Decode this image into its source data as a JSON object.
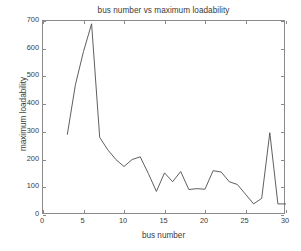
{
  "chart_data": {
    "type": "line",
    "title": "bus number vs maximum loadability",
    "xlabel": "bus number",
    "ylabel": "maximum loadability",
    "xlim": [
      0,
      30
    ],
    "ylim": [
      0,
      700
    ],
    "xticks": [
      0,
      5,
      10,
      15,
      20,
      25,
      30
    ],
    "yticks": [
      0,
      100,
      200,
      300,
      400,
      500,
      600,
      700
    ],
    "grid": false,
    "legend": false,
    "line_color": "#4d4d4d",
    "series": [
      {
        "name": "maximum loadability",
        "x": [
          3,
          4,
          5,
          6,
          7,
          8,
          9,
          10,
          11,
          12,
          13,
          14,
          15,
          16,
          17,
          18,
          19,
          20,
          21,
          22,
          23,
          24,
          25,
          26,
          27,
          28,
          29,
          30
        ],
        "values": [
          290,
          470,
          590,
          690,
          280,
          235,
          200,
          175,
          200,
          210,
          150,
          85,
          152,
          120,
          157,
          92,
          95,
          93,
          160,
          155,
          120,
          110,
          75,
          40,
          60,
          297,
          40,
          40
        ]
      }
    ]
  },
  "axes": {
    "x_tick_labels": [
      "0",
      "5",
      "10",
      "15",
      "20",
      "25",
      "30"
    ],
    "y_tick_labels": [
      "0",
      "100",
      "200",
      "300",
      "400",
      "500",
      "600",
      "700"
    ]
  }
}
